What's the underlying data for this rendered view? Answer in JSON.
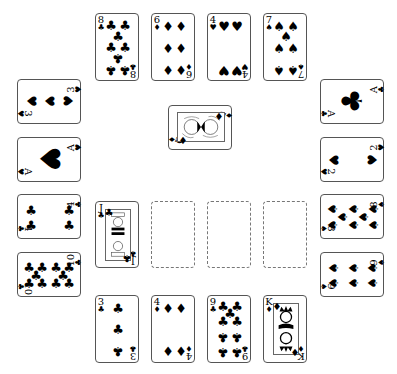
{
  "table": {
    "top_row": [
      {
        "rank": "8",
        "suit": "♣",
        "suit_name": "clubs"
      },
      {
        "rank": "6",
        "suit": "♦",
        "suit_name": "diamonds"
      },
      {
        "rank": "4",
        "suit": "♥",
        "suit_name": "hearts"
      },
      {
        "rank": "7",
        "suit": "♠",
        "suit_name": "spades"
      }
    ],
    "left_column": [
      {
        "rank": "3",
        "suit": "♥",
        "suit_name": "hearts"
      },
      {
        "rank": "A",
        "suit": "♥",
        "suit_name": "hearts"
      },
      {
        "rank": "4",
        "suit": "♣",
        "suit_name": "clubs"
      },
      {
        "rank": "10",
        "suit": "♣",
        "suit_name": "clubs"
      }
    ],
    "right_column": [
      {
        "rank": "A",
        "suit": "♣",
        "suit_name": "clubs"
      },
      {
        "rank": "2",
        "suit": "♥",
        "suit_name": "hearts"
      },
      {
        "rank": "8",
        "suit": "♠",
        "suit_name": "spades"
      },
      {
        "rank": "9",
        "suit": "♠",
        "suit_name": "spades"
      }
    ],
    "center_card": {
      "rank": "Q",
      "suit": "♦",
      "suit_name": "diamonds"
    },
    "middle_row": [
      {
        "rank": "J",
        "suit": "♣",
        "suit_name": "clubs"
      },
      {
        "empty": true
      },
      {
        "empty": true
      },
      {
        "empty": true
      }
    ],
    "bottom_row": [
      {
        "rank": "3",
        "suit": "♣",
        "suit_name": "clubs"
      },
      {
        "rank": "4",
        "suit": "♦",
        "suit_name": "diamonds"
      },
      {
        "rank": "9",
        "suit": "♣",
        "suit_name": "clubs"
      },
      {
        "rank": "K",
        "suit": "♦",
        "suit_name": "diamonds"
      }
    ]
  },
  "colors": {
    "background": "#ffffff",
    "card_border": "#555555",
    "ink": "#000000"
  }
}
